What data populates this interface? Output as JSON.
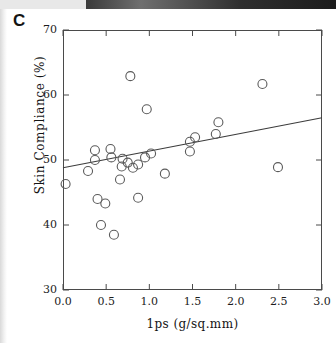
{
  "panel": {
    "label": "C"
  },
  "chart_data": {
    "type": "scatter",
    "title": "",
    "xlabel": "1ps (g/sq.mm)",
    "ylabel": "Skin Compliance (%)",
    "xlim": [
      0.0,
      3.0
    ],
    "ylim": [
      30,
      70
    ],
    "xticks": [
      "0.0",
      "0.5",
      "1.0",
      "1.5",
      "2.0",
      "2.5",
      "3.0"
    ],
    "xtick_values": [
      0.0,
      0.5,
      1.0,
      1.5,
      2.0,
      2.5,
      3.0
    ],
    "yticks": [
      "30",
      "40",
      "50",
      "60",
      "70"
    ],
    "ytick_values": [
      30,
      40,
      50,
      60,
      70
    ],
    "grid": false,
    "legend": false,
    "marker": "open-circle",
    "marker_size": 9,
    "marker_color": "#5a5a5a",
    "line_color": "#3c3c3c",
    "axis_color": "#4a4a4a",
    "series": [
      {
        "name": "Skin compliance vs 1ps",
        "points": [
          {
            "x": 0.03,
            "y": 46.3
          },
          {
            "x": 0.29,
            "y": 48.3
          },
          {
            "x": 0.37,
            "y": 51.5
          },
          {
            "x": 0.37,
            "y": 50.0
          },
          {
            "x": 0.4,
            "y": 44.0
          },
          {
            "x": 0.44,
            "y": 40.0
          },
          {
            "x": 0.49,
            "y": 43.3
          },
          {
            "x": 0.55,
            "y": 51.7
          },
          {
            "x": 0.56,
            "y": 50.4
          },
          {
            "x": 0.59,
            "y": 38.5
          },
          {
            "x": 0.66,
            "y": 47.0
          },
          {
            "x": 0.75,
            "y": 49.6
          },
          {
            "x": 0.78,
            "y": 62.9
          },
          {
            "x": 0.69,
            "y": 50.2
          },
          {
            "x": 0.68,
            "y": 49.0
          },
          {
            "x": 0.81,
            "y": 48.8
          },
          {
            "x": 0.87,
            "y": 49.3
          },
          {
            "x": 0.87,
            "y": 44.2
          },
          {
            "x": 0.97,
            "y": 57.8
          },
          {
            "x": 0.95,
            "y": 50.4
          },
          {
            "x": 1.02,
            "y": 51.0
          },
          {
            "x": 1.18,
            "y": 47.9
          },
          {
            "x": 1.47,
            "y": 52.8
          },
          {
            "x": 1.47,
            "y": 51.3
          },
          {
            "x": 1.53,
            "y": 53.5
          },
          {
            "x": 1.77,
            "y": 54.0
          },
          {
            "x": 1.8,
            "y": 55.8
          },
          {
            "x": 2.31,
            "y": 61.7
          },
          {
            "x": 2.49,
            "y": 48.9
          }
        ]
      }
    ],
    "regression_line": {
      "x1": 0.0,
      "y1": 48.8,
      "x2": 3.0,
      "y2": 56.5
    }
  }
}
